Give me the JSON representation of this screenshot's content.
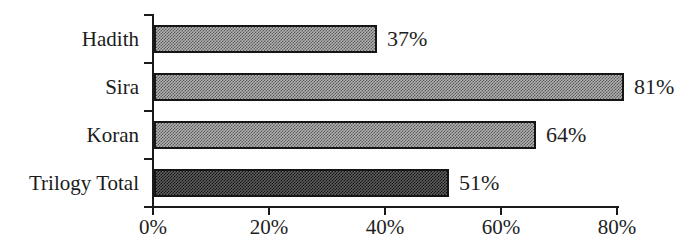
{
  "chart_data": {
    "type": "bar",
    "orientation": "horizontal",
    "title": "",
    "xlabel": "",
    "ylabel": "",
    "categories": [
      "Hadith",
      "Sira",
      "Koran",
      "Trilogy Total"
    ],
    "values": [
      37,
      81,
      64,
      51
    ],
    "value_labels": [
      "37%",
      "81%",
      "64%",
      "51%"
    ],
    "xlim": [
      0,
      80
    ],
    "x_tick_values": [
      0,
      20,
      40,
      60,
      80
    ],
    "x_tick_labels": [
      "0%",
      "20%",
      "40%",
      "60%",
      "80%"
    ],
    "grid": "off",
    "legend": "none",
    "bar_colors": [
      "#8f8f8f",
      "#8f8f8f",
      "#8f8f8f",
      "#3d3d3d"
    ],
    "bar_border_color": "#151515",
    "value_label_position": "right-of-bar"
  },
  "figure": {
    "background": "#ffffff",
    "axis_color": "#1a1a1a",
    "text_color": "#1e1e1e",
    "items": [
      {
        "label": "Hadith",
        "value": 37,
        "value_label": "37%",
        "render_pct": 38.7,
        "base": "#b2b2b2",
        "dot": "#595959"
      },
      {
        "label": "Sira",
        "value": 81,
        "value_label": "81%",
        "render_pct": 81.2,
        "base": "#b2b2b2",
        "dot": "#595959"
      },
      {
        "label": "Koran",
        "value": 64,
        "value_label": "64%",
        "render_pct": 66.1,
        "base": "#b2b2b2",
        "dot": "#595959"
      },
      {
        "label": "Trilogy Total",
        "value": 51,
        "value_label": "51%",
        "render_pct": 51.0,
        "base": "#5e5e5e",
        "dot": "#141414"
      }
    ],
    "x_axis": {
      "tick_labels": [
        "0%",
        "20%",
        "40%",
        "60%",
        "80%"
      ],
      "tick_values": [
        0,
        20,
        40,
        60,
        80
      ],
      "max": 80
    }
  }
}
